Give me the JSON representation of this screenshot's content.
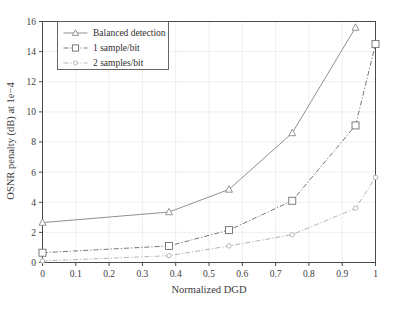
{
  "chart_data": {
    "type": "line",
    "title": "",
    "xlabel": "Normalized DGD",
    "ylabel": "OSNR penalty (dB) at 1e−4",
    "xlim": [
      0,
      1
    ],
    "ylim": [
      0,
      16
    ],
    "grid": true,
    "legend_position": "top-left",
    "xticks": [
      "0",
      "0.1",
      "0.2",
      "0.3",
      "0.4",
      "0.5",
      "0.6",
      "0.7",
      "0.8",
      "0.9",
      "1"
    ],
    "xtick_values": [
      0,
      0.1,
      0.2,
      0.3,
      0.4,
      0.5,
      0.6,
      0.7,
      0.8,
      0.9,
      1
    ],
    "yticks": [
      "0",
      "2",
      "4",
      "6",
      "8",
      "10",
      "12",
      "14",
      "16"
    ],
    "ytick_values": [
      0,
      2,
      4,
      6,
      8,
      10,
      12,
      14,
      16
    ],
    "series": [
      {
        "name": "Balanced detection",
        "marker": "triangle",
        "linestyle": "solid",
        "color": "#8a8a8a",
        "x": [
          0,
          0.38,
          0.56,
          0.75,
          0.94
        ],
        "values": [
          2.65,
          3.35,
          4.85,
          8.6,
          15.6
        ]
      },
      {
        "name": "1 sample/bit",
        "marker": "square",
        "linestyle": "dashdot",
        "color": "#6e6e6e",
        "x": [
          0,
          0.38,
          0.56,
          0.75,
          0.94,
          1
        ],
        "values": [
          0.65,
          1.1,
          2.15,
          4.1,
          9.1,
          14.5
        ]
      },
      {
        "name": "2 samples/bit",
        "marker": "circle",
        "linestyle": "dashdot",
        "color": "#b0b0b0",
        "x": [
          0,
          0.38,
          0.56,
          0.75,
          0.94,
          1
        ],
        "values": [
          0.1,
          0.45,
          1.1,
          1.85,
          3.6,
          5.65
        ]
      }
    ]
  },
  "legend": {
    "items": [
      {
        "label": "Balanced detection"
      },
      {
        "label": "1 sample/bit"
      },
      {
        "label": "2 samples/bit"
      }
    ]
  },
  "colors": {
    "axis": "#4a4a4a",
    "grid": "#e8e8e8",
    "background": "#ffffff",
    "text": "#3c3c3c"
  }
}
